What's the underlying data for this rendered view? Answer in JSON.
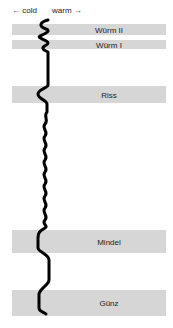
{
  "axis": {
    "cold_label": "← cold",
    "warm_label": "warm →"
  },
  "bands": [
    {
      "name": "Würm II",
      "top": 24,
      "height": 11
    },
    {
      "name": "Würm I",
      "top": 40,
      "height": 9
    },
    {
      "name": "Riss",
      "top": 86,
      "height": 17
    },
    {
      "name": "Mindel",
      "top": 230,
      "height": 23
    },
    {
      "name": "Günz",
      "top": 290,
      "height": 26
    }
  ],
  "colors": {
    "band": "#d6d6d6",
    "curve": "#000000",
    "background": "#ffffff"
  }
}
